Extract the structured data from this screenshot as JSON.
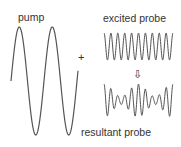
{
  "labels": {
    "pump": "pump",
    "excited_probe": "excited probe",
    "resultant_probe": "resultant probe",
    "plus": "+",
    "arrow": "⇩"
  },
  "colors": {
    "line": "#555555",
    "text": "#333333"
  },
  "waves": {
    "pump": {
      "x_start": 11,
      "x_end": 78,
      "center_y": 81,
      "amplitude": 54,
      "period": 33,
      "phase_start": "zero-rising-to-peak",
      "cycles": 2
    },
    "excited_probe": {
      "x_start": 104,
      "x_end": 173,
      "center_y": 46.5,
      "amplitude": 13.5,
      "period": 6.9,
      "cycles": 10
    },
    "resultant_probe": {
      "x_start": 104,
      "x_end": 173,
      "center_y": 100.5,
      "amplitude_max": 16.5,
      "period": 6.9,
      "cycles": 10,
      "modulation": "amplitude modulated by pump"
    }
  }
}
